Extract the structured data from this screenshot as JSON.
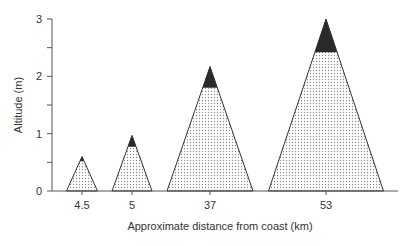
{
  "chart_data": {
    "type": "area",
    "title": "",
    "xlabel": "Approximate distance from coast (km)",
    "ylabel": "Altitude (m)",
    "ylim": [
      0,
      3
    ],
    "yticks": [
      0,
      1,
      2,
      3
    ],
    "grid": false,
    "legend": null,
    "categories": [
      "4.5",
      "5",
      "37",
      "53"
    ],
    "series": [
      {
        "name": "peak height (total)",
        "values": [
          0.6,
          0.97,
          2.17,
          3.0
        ]
      },
      {
        "name": "dotted section top (dark cap base)",
        "values": [
          0.52,
          0.77,
          1.8,
          2.42
        ]
      }
    ],
    "shapes": "triangles with dotted fill and solid dark cap at apex",
    "base_widths_px": [
      31,
      40,
      86,
      115
    ]
  },
  "colors": {
    "dot_fill": "#9a9a9a",
    "cap_fill": "#2a2a2a",
    "outline": "#333333",
    "axis": "#555555"
  }
}
